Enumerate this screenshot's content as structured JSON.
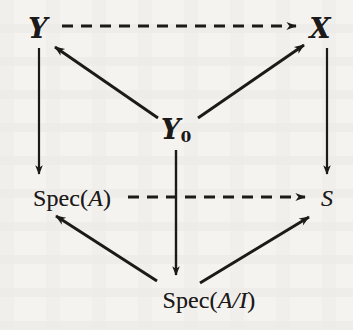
{
  "figure": {
    "kind": "commutative-diagram",
    "background_color": "#f4f3f0",
    "ink_color": "#1c1a19",
    "width": 353,
    "height": 330
  },
  "nodes": [
    {
      "id": "Y",
      "label": "у",
      "display": "Y",
      "style": "script",
      "x": 38,
      "y": 28,
      "role": "top-left"
    },
    {
      "id": "X",
      "label": "X",
      "display": "X",
      "style": "script",
      "x": 320,
      "y": 28,
      "role": "top-right"
    },
    {
      "id": "Y0",
      "label": "Y",
      "subscript": "0",
      "display": "Y0",
      "style": "script",
      "x": 176,
      "y": 131,
      "role": "center"
    },
    {
      "id": "SpecA",
      "label": "Spec(A)",
      "prefix": "Spec(",
      "italic": "A",
      "suffix": ")",
      "style": "roman",
      "x": 72,
      "y": 198,
      "role": "middle-left"
    },
    {
      "id": "S",
      "label": "S",
      "display": "S",
      "style": "roman-italic",
      "x": 327,
      "y": 198,
      "role": "middle-right"
    },
    {
      "id": "SpecAI",
      "label": "Spec(A/I)",
      "prefix": "Spec(",
      "italic": "A/I",
      "suffix": ")",
      "style": "roman",
      "x": 209,
      "y": 300,
      "role": "bottom-center"
    }
  ],
  "arrows": [
    {
      "id": "Y-to-X",
      "from": "Y",
      "to": "X",
      "line": "dashed",
      "direction": "right",
      "x1": 62,
      "y1": 26,
      "x2": 300,
      "y2": 26
    },
    {
      "id": "Y-to-SpecA",
      "from": "Y",
      "to": "SpecA",
      "line": "solid",
      "direction": "down",
      "x1": 39,
      "y1": 48,
      "x2": 39,
      "y2": 178
    },
    {
      "id": "X-to-S",
      "from": "X",
      "to": "S",
      "line": "solid",
      "direction": "down",
      "x1": 327,
      "y1": 48,
      "x2": 327,
      "y2": 178
    },
    {
      "id": "Y0-to-Y",
      "from": "Y0",
      "to": "Y",
      "line": "solid",
      "direction": "up-left",
      "x1": 156,
      "y1": 117,
      "x2": 52,
      "y2": 45
    },
    {
      "id": "Y0-to-X",
      "from": "Y0",
      "to": "X",
      "line": "solid",
      "direction": "up-right",
      "x1": 199,
      "y1": 117,
      "x2": 307,
      "y2": 43
    },
    {
      "id": "SpecA-to-S",
      "from": "SpecA",
      "to": "S",
      "line": "dashed",
      "direction": "right",
      "x1": 128,
      "y1": 198,
      "x2": 308,
      "y2": 198
    },
    {
      "id": "Y0-to-SpecAI",
      "from": "Y0",
      "to": "SpecAI",
      "line": "solid",
      "direction": "down",
      "x1": 176,
      "y1": 150,
      "x2": 176,
      "y2": 278
    },
    {
      "id": "SpecAI-to-SpecA",
      "from": "SpecAI",
      "to": "SpecA",
      "line": "solid",
      "direction": "up-left",
      "x1": 155,
      "y1": 280,
      "x2": 53,
      "y2": 214
    },
    {
      "id": "SpecAI-to-S",
      "from": "SpecAI",
      "to": "S",
      "line": "solid",
      "direction": "up-right",
      "x1": 200,
      "y1": 282,
      "x2": 312,
      "y2": 215
    }
  ]
}
